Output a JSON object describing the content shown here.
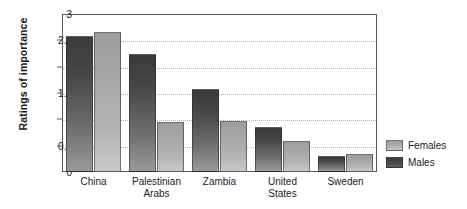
{
  "chart_data": {
    "type": "bar",
    "title": "",
    "xlabel": "",
    "ylabel": "Ratings of importance",
    "ylim": [
      0,
      3
    ],
    "yticks": [
      "0",
      "0.5",
      "1",
      "1.5",
      "2",
      "2.5",
      "3"
    ],
    "ytick_values": [
      0,
      0.5,
      1,
      1.5,
      2,
      2.5,
      3
    ],
    "grid": true,
    "legend_position": "right",
    "categories": [
      "China",
      "Palestinian\nArabs",
      "Zambia",
      "United\nStates",
      "Sweden"
    ],
    "series": [
      {
        "name": "Males",
        "values": [
          2.58,
          2.25,
          1.57,
          0.85,
          0.3
        ]
      },
      {
        "name": "Females",
        "values": [
          2.65,
          0.95,
          0.97,
          0.58,
          0.35
        ]
      }
    ]
  },
  "legend": {
    "items": [
      {
        "label": "Females",
        "swatch": "females-swatch"
      },
      {
        "label": "Males",
        "swatch": "males-swatch"
      }
    ]
  },
  "axis": {
    "y_title": "Ratings of importance"
  }
}
